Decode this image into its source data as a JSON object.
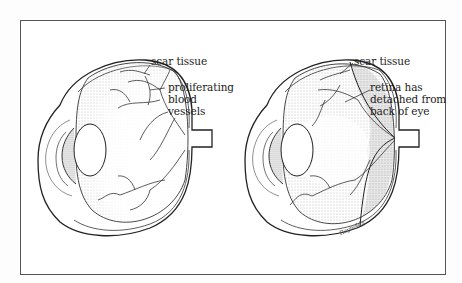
{
  "figure": {
    "left_eye": {
      "name": "eye with proliferating blood vessels",
      "labels": {
        "scar_tissue": "scar tissue",
        "vessels_line1": "proliferating",
        "vessels_line2": "blood",
        "vessels_line3": "vessels"
      }
    },
    "right_eye": {
      "name": "eye with detached retina",
      "labels": {
        "scar_tissue": "scar tissue",
        "retina_line1": "retina has",
        "retina_line2": "detached from",
        "retina_line3": "back of eye"
      }
    },
    "signature": "Reynolds"
  },
  "colors": {
    "ink": "#222222",
    "frame": "#555555",
    "stipple": "#888888",
    "background": "#ffffff"
  }
}
